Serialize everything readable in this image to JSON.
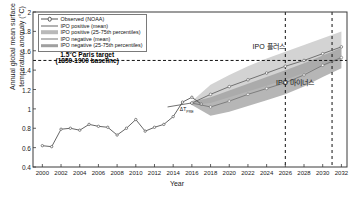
{
  "chart_data": {
    "type": "line",
    "title": "",
    "xlabel": "Year",
    "ylabel": "Annual global mean surface temperature anomaly (°C)",
    "xlim": [
      1999,
      2032.6
    ],
    "ylim": [
      0.4,
      2.0
    ],
    "grid": false,
    "legend_position": "top-left",
    "xticks": [
      "2000",
      "2002",
      "2004",
      "2006",
      "2008",
      "2010",
      "2012",
      "2014",
      "2016",
      "2018",
      "2020",
      "2022",
      "2024",
      "2026",
      "2028",
      "2030",
      "2032"
    ],
    "yticks": [
      "2",
      "1.8",
      "1.6",
      "1.4",
      "1.2",
      "1",
      "0.8",
      "0.6",
      "0.4"
    ],
    "legend": [
      {
        "label": "Observed (NOAA)",
        "key": "line-marker",
        "color": "#555555"
      },
      {
        "label": "IPO positive (mean)",
        "key": "line",
        "color": "#666666"
      },
      {
        "label": "IPO positive (25-75th percentiles)",
        "key": "band",
        "color": "#b9b9b9"
      },
      {
        "label": "IPO negative (mean)",
        "key": "line",
        "color": "#777777"
      },
      {
        "label": "IPO negative (25-75th percentiles)",
        "key": "band",
        "color": "#a0a0a0"
      }
    ],
    "series": [
      {
        "name": "Observed (NOAA)",
        "x": [
          2000,
          2001,
          2002,
          2003,
          2004,
          2005,
          2006,
          2007,
          2008,
          2009,
          2010,
          2011,
          2012,
          2013,
          2014,
          2015,
          2016,
          2017
        ],
        "values": [
          0.62,
          0.61,
          0.79,
          0.8,
          0.78,
          0.84,
          0.82,
          0.81,
          0.73,
          0.8,
          0.89,
          0.77,
          0.81,
          0.84,
          0.92,
          1.07,
          1.12,
          1.05
        ]
      },
      {
        "name": "IPO positive (mean)",
        "x": [
          2016,
          2018,
          2020,
          2022,
          2024,
          2026,
          2028,
          2030,
          2032
        ],
        "values": [
          1.06,
          1.15,
          1.23,
          1.3,
          1.37,
          1.44,
          1.5,
          1.57,
          1.64
        ]
      },
      {
        "name": "IPO negative (mean)",
        "x": [
          2016,
          2018,
          2020,
          2022,
          2024,
          2026,
          2028,
          2030,
          2032
        ],
        "values": [
          1.06,
          1.02,
          1.08,
          1.15,
          1.21,
          1.27,
          1.35,
          1.45,
          1.53
        ]
      }
    ],
    "bands": [
      {
        "name": "IPO positive (25-75th percentiles)",
        "x": [
          2016,
          2018,
          2020,
          2022,
          2024,
          2026,
          2028,
          2030,
          2032
        ],
        "upper": [
          1.08,
          1.25,
          1.35,
          1.44,
          1.52,
          1.59,
          1.66,
          1.73,
          1.8
        ],
        "lower": [
          1.04,
          1.06,
          1.12,
          1.18,
          1.24,
          1.3,
          1.37,
          1.44,
          1.51
        ]
      },
      {
        "name": "IPO negative (25-75th percentiles)",
        "x": [
          2016,
          2018,
          2020,
          2022,
          2024,
          2026,
          2028,
          2030,
          2032
        ],
        "upper": [
          1.07,
          1.12,
          1.19,
          1.26,
          1.33,
          1.4,
          1.47,
          1.55,
          1.63
        ],
        "lower": [
          1.04,
          0.93,
          0.97,
          1.03,
          1.09,
          1.15,
          1.23,
          1.33,
          1.42
        ]
      }
    ],
    "threshold_line": {
      "value": 1.5,
      "style": "dashed",
      "color": "#111111"
    },
    "vertical_lines": [
      {
        "x": 2026,
        "style": "dashed",
        "color": "#111111"
      },
      {
        "x": 2031,
        "style": "dashed",
        "color": "#111111"
      }
    ],
    "annotations": [
      {
        "text": "1.5°C Paris target",
        "x": 2004.8,
        "y": 1.57
      },
      {
        "text": "(1850-1900 baseline)",
        "x": 2004.8,
        "y": 1.5
      },
      {
        "text": "IPO 플러스",
        "x": 2022.5,
        "y": 1.66
      },
      {
        "text": "IPO 마이너스",
        "x": 2025.0,
        "y": 1.29
      },
      {
        "text": "ΔT",
        "x": 2016.0,
        "y": 1.0
      },
      {
        "text": "PRE",
        "x": 2017.2,
        "y": 0.96
      }
    ]
  },
  "colors": {
    "observed_line": "#555555",
    "ipo_pos_mean": "#666666",
    "ipo_neg_mean": "#777777",
    "ipo_pos_band": "#c4c4c4",
    "ipo_neg_band": "#9e9e9e",
    "axis": "#3a3a3a",
    "text": "#111111"
  }
}
